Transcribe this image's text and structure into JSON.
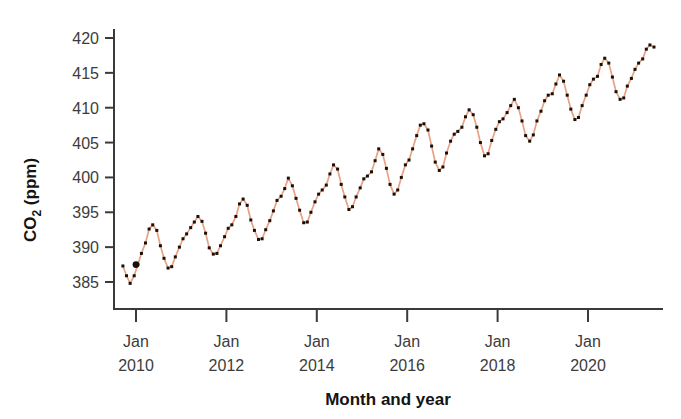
{
  "figure": {
    "background_color": "#ffffff"
  },
  "chart_data": {
    "type": "line",
    "title": "",
    "xlabel": "Month and year",
    "ylabel": "CO2 (ppm)",
    "ylabel_display": "CO",
    "ylabel_sub": "2",
    "ylabel_tail": " (ppm)",
    "line_color": "#e8a183",
    "marker_color": "#1a1008",
    "axis_color": "#3a3a3a",
    "grid": false,
    "legend": false,
    "legend_position": "none",
    "xlim": [
      2009.71,
      2021.54
    ],
    "ylim": [
      382.0,
      421.5
    ],
    "yticks": [
      385,
      390,
      395,
      400,
      405,
      410,
      415,
      420
    ],
    "ytick_labels": [
      "385",
      "390",
      "395",
      "400",
      "405",
      "410",
      "415",
      "420"
    ],
    "xticks": [
      2010,
      2012,
      2014,
      2016,
      2018,
      2020
    ],
    "xtick_labels": [
      {
        "month": "Jan",
        "year": "2010"
      },
      {
        "month": "Jan",
        "year": "2012"
      },
      {
        "month": "Jan",
        "year": "2014"
      },
      {
        "month": "Jan",
        "year": "2016"
      },
      {
        "month": "Jan",
        "year": "2018"
      },
      {
        "month": "Jan",
        "year": "2020"
      }
    ],
    "emphasized_point": {
      "x": 2010.0,
      "y": 387.5,
      "label": "Jan 2010"
    },
    "series": [
      {
        "name": "Monthly mean atmospheric CO2",
        "x": [
          2009.71,
          2009.79,
          2009.87,
          2009.96,
          2010.04,
          2010.12,
          2010.21,
          2010.29,
          2010.37,
          2010.46,
          2010.54,
          2010.62,
          2010.71,
          2010.79,
          2010.87,
          2010.96,
          2011.04,
          2011.12,
          2011.21,
          2011.29,
          2011.37,
          2011.46,
          2011.54,
          2011.62,
          2011.71,
          2011.79,
          2011.87,
          2011.96,
          2012.04,
          2012.12,
          2012.21,
          2012.29,
          2012.37,
          2012.46,
          2012.54,
          2012.62,
          2012.71,
          2012.79,
          2012.87,
          2012.96,
          2013.04,
          2013.12,
          2013.21,
          2013.29,
          2013.37,
          2013.46,
          2013.54,
          2013.62,
          2013.71,
          2013.79,
          2013.87,
          2013.96,
          2014.04,
          2014.12,
          2014.21,
          2014.29,
          2014.37,
          2014.46,
          2014.54,
          2014.62,
          2014.71,
          2014.79,
          2014.87,
          2014.96,
          2015.04,
          2015.12,
          2015.21,
          2015.29,
          2015.37,
          2015.46,
          2015.54,
          2015.62,
          2015.71,
          2015.79,
          2015.87,
          2015.96,
          2016.04,
          2016.12,
          2016.21,
          2016.29,
          2016.37,
          2016.46,
          2016.54,
          2016.62,
          2016.71,
          2016.79,
          2016.87,
          2016.96,
          2017.04,
          2017.12,
          2017.21,
          2017.29,
          2017.37,
          2017.46,
          2017.54,
          2017.62,
          2017.71,
          2017.79,
          2017.87,
          2017.96,
          2018.04,
          2018.12,
          2018.21,
          2018.29,
          2018.37,
          2018.46,
          2018.54,
          2018.62,
          2018.71,
          2018.79,
          2018.87,
          2018.96,
          2019.04,
          2019.12,
          2019.21,
          2019.29,
          2019.37,
          2019.46,
          2019.54,
          2019.62,
          2019.71,
          2019.79,
          2019.87,
          2019.96,
          2020.04,
          2020.12,
          2020.21,
          2020.29,
          2020.37,
          2020.46,
          2020.54,
          2020.62,
          2020.71,
          2020.79,
          2020.87,
          2020.96,
          2021.04,
          2021.12,
          2021.21,
          2021.29,
          2021.37,
          2021.46
        ],
        "y": [
          387.3,
          385.9,
          384.8,
          385.9,
          387.5,
          389.1,
          390.6,
          392.6,
          393.2,
          392.4,
          390.2,
          388.4,
          387.0,
          387.2,
          388.6,
          390.0,
          391.2,
          391.9,
          392.8,
          393.6,
          394.4,
          393.7,
          392.0,
          389.9,
          389.0,
          389.1,
          390.2,
          391.5,
          392.7,
          393.2,
          394.4,
          396.2,
          396.9,
          396.0,
          393.9,
          392.4,
          391.1,
          391.2,
          392.5,
          393.8,
          395.2,
          396.7,
          397.3,
          398.4,
          399.9,
          398.8,
          397.0,
          395.3,
          393.5,
          393.6,
          395.0,
          396.5,
          397.6,
          398.2,
          398.9,
          400.5,
          401.8,
          401.2,
          399.0,
          397.2,
          395.4,
          395.8,
          397.2,
          398.5,
          399.8,
          400.2,
          400.8,
          402.4,
          404.1,
          403.3,
          401.3,
          399.0,
          397.6,
          398.2,
          400.0,
          401.8,
          402.5,
          404.1,
          406.0,
          407.5,
          407.7,
          406.8,
          404.5,
          402.2,
          401.0,
          401.5,
          403.5,
          405.2,
          406.2,
          406.6,
          407.2,
          408.7,
          409.7,
          409.0,
          407.2,
          405.0,
          403.1,
          403.4,
          405.3,
          406.9,
          408.0,
          408.4,
          409.3,
          410.3,
          411.2,
          410.0,
          408.1,
          406.0,
          405.2,
          406.1,
          408.1,
          409.5,
          411.0,
          411.8,
          412.0,
          413.4,
          414.7,
          413.8,
          411.8,
          409.8,
          408.3,
          408.6,
          410.3,
          411.8,
          413.3,
          414.1,
          414.5,
          416.2,
          417.1,
          416.4,
          414.4,
          412.3,
          411.2,
          411.4,
          413.1,
          414.2,
          415.5,
          416.4,
          417.0,
          418.4,
          419.0,
          418.7
        ]
      }
    ]
  }
}
